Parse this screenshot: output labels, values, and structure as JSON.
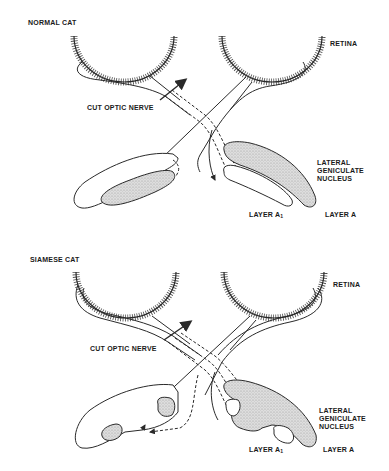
{
  "panels": [
    {
      "id": "normal",
      "title": "NORMAL CAT",
      "labels": {
        "retina": "RETINA",
        "cut_optic_nerve": "CUT OPTIC NERVE",
        "lgn_line1": "LATERAL",
        "lgn_line2": "GENICULATE",
        "lgn_line3": "NUCLEUS",
        "layer_a1": "LAYER A",
        "layer_a1_sub": "1",
        "layer_a": "LAYER A"
      }
    },
    {
      "id": "siamese",
      "title": "SIAMESE CAT",
      "labels": {
        "retina": "RETINA",
        "cut_optic_nerve": "CUT OPTIC NERVE",
        "lgn_line1": "LATERAL",
        "lgn_line2": "GENICULATE",
        "lgn_line3": "NUCLEUS",
        "layer_a1": "LAYER A",
        "layer_a1_sub": "1",
        "layer_a": "LAYER A"
      }
    }
  ],
  "colors": {
    "ink": "#2a2a2a",
    "stipple": "#d4d4d4",
    "background": "#ffffff"
  }
}
